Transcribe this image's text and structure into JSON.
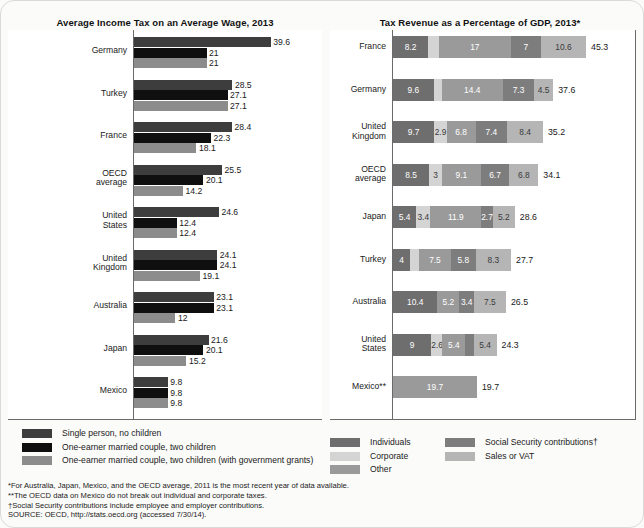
{
  "titles": {
    "left": "Average Income Tax on an Average Wage, 2013",
    "right": "Tax Revenue as a Percentage of GDP, 2013*"
  },
  "colors": {
    "single_no_children": "#3d3d3d",
    "married_two_children": "#0f0f0f",
    "married_two_children_grants": "#8c8c8c",
    "individuals": "#6e6e6e",
    "corporate": "#d4d4d4",
    "other": "#9a9a9a",
    "social_security": "#7d7d7d",
    "sales_vat": "#b5b5b5",
    "axis": "#6a6a6a"
  },
  "legend_left": [
    {
      "label": "Single person, no children",
      "color": "#3d3d3d"
    },
    {
      "label": "One-earner married couple, two children",
      "color": "#0f0f0f"
    },
    {
      "label": "One-earner married couple, two children (with government grants)",
      "color": "#8c8c8c"
    }
  ],
  "legend_right_col1": [
    {
      "label": "Individuals",
      "color": "#6e6e6e"
    },
    {
      "label": "Corporate",
      "color": "#d4d4d4"
    },
    {
      "label": "Other",
      "color": "#9a9a9a"
    }
  ],
  "legend_right_col2": [
    {
      "label": "Social Security contributions†",
      "color": "#7d7d7d"
    },
    {
      "label": "Sales or VAT",
      "color": "#b5b5b5"
    }
  ],
  "footnotes": [
    "*For Australia, Japan, Mexico, and the OECD average, 2011 is the most recent year of data available.",
    "**The OECD data on Mexico do not break out individual and corporate taxes.",
    "†Social Security contributions include employee and employer contributions.",
    "SOURCE: OECD, http://stats.oecd.org (accessed 7/30/14)."
  ],
  "chart_data": [
    {
      "type": "bar",
      "orientation": "horizontal",
      "title": "Average Income Tax on an Average Wage, 2013",
      "xlabel": "",
      "ylabel": "",
      "xlim": [
        0,
        42
      ],
      "grid": false,
      "legend_position": "below",
      "categories": [
        "Germany",
        "Turkey",
        "France",
        "OECD\naverage",
        "United\nStates",
        "United\nKingdom",
        "Australia",
        "Japan",
        "Mexico"
      ],
      "series": [
        {
          "name": "Single person, no children",
          "color": "#3d3d3d",
          "values": [
            39.6,
            28.5,
            28.4,
            25.5,
            24.6,
            24.1,
            23.1,
            21.6,
            9.8
          ]
        },
        {
          "name": "One-earner married couple, two children",
          "color": "#0f0f0f",
          "values": [
            21,
            27.1,
            22.3,
            20.1,
            12.4,
            24.1,
            23.1,
            20.1,
            9.8
          ]
        },
        {
          "name": "One-earner married couple, two children (with government grants)",
          "color": "#8c8c8c",
          "values": [
            21,
            27.1,
            18.1,
            14.2,
            12.4,
            19.1,
            12,
            15.2,
            9.8
          ]
        }
      ]
    },
    {
      "type": "bar",
      "subtype": "stacked",
      "orientation": "horizontal",
      "title": "Tax Revenue as a Percentage of GDP, 2013*",
      "xlabel": "",
      "ylabel": "",
      "xlim": [
        0,
        46
      ],
      "grid": false,
      "legend_position": "below",
      "categories": [
        "France",
        "Germany",
        "United\nKingdom",
        "OECD\naverage",
        "Japan",
        "Turkey",
        "Australia",
        "United\nStates",
        "Mexico**"
      ],
      "series": [
        {
          "name": "Individuals",
          "color": "#6e6e6e",
          "values": [
            8.2,
            9.6,
            9.7,
            8.5,
            5.4,
            4,
            10.4,
            9,
            null
          ]
        },
        {
          "name": "Corporate",
          "color": "#d4d4d4",
          "values": [
            2.5,
            1.8,
            2.9,
            3,
            3.4,
            2.1,
            null,
            2.6,
            null
          ]
        },
        {
          "name": "Other",
          "color": "#9a9a9a",
          "values": [
            17,
            14.4,
            6.8,
            9.1,
            11.9,
            7.5,
            5.2,
            5.4,
            19.7
          ]
        },
        {
          "name": "Social Security contributions†",
          "color": "#7d7d7d",
          "values": [
            7,
            7.3,
            7.4,
            6.7,
            2.7,
            5.8,
            3.4,
            1.9,
            null
          ]
        },
        {
          "name": "Sales or VAT",
          "color": "#b5b5b5",
          "values": [
            10.6,
            4.5,
            8.4,
            6.8,
            5.2,
            8.3,
            7.5,
            5.4,
            null
          ]
        }
      ],
      "totals": [
        45.3,
        37.6,
        35.2,
        34.1,
        28.6,
        27.7,
        26.5,
        24.3,
        19.7
      ]
    }
  ]
}
